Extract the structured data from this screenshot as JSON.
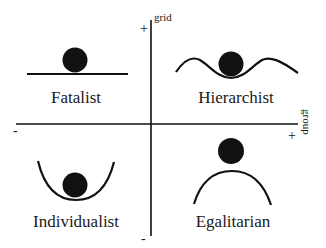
{
  "diagram": {
    "type": "grid-group quadrant diagram",
    "axes": {
      "vertical": {
        "name": "grid",
        "positive_sign": "+",
        "negative_sign": "-"
      },
      "horizontal": {
        "name": "group",
        "positive_sign": "+",
        "negative_sign": "-"
      }
    },
    "quadrants": [
      {
        "position": "top-left",
        "label": "Fatalist",
        "shape": "flat line with ball on top"
      },
      {
        "position": "top-right",
        "label": "Hierarchist",
        "shape": "wave with ball in central trough"
      },
      {
        "position": "bottom-left",
        "label": "Individualist",
        "shape": "U-shaped valley with ball at bottom"
      },
      {
        "position": "bottom-right",
        "label": "Egalitarian",
        "shape": "hill/arch with ball balanced on top"
      }
    ],
    "colors": {
      "ink": "#111111",
      "background": "#ffffff"
    }
  }
}
